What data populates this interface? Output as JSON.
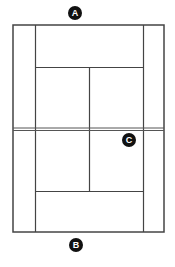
{
  "diagram": {
    "type": "tennis-court-top-view",
    "line_color": "#444444",
    "badge_color": "#111111",
    "badge_text_color": "#ffffff",
    "labels": [
      {
        "id": "A",
        "text": "A",
        "position": "above far baseline"
      },
      {
        "id": "B",
        "text": "B",
        "position": "below near baseline"
      },
      {
        "id": "C",
        "text": "C",
        "position": "near side right service box, just below net"
      }
    ]
  }
}
